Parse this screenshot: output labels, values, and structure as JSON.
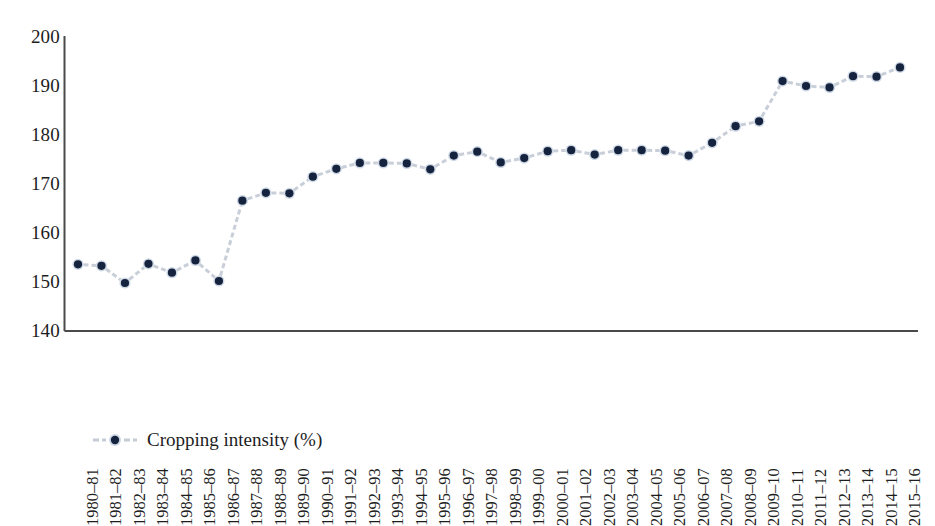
{
  "chart_data": {
    "type": "line",
    "title": "",
    "xlabel": "",
    "ylabel": "",
    "ylim": [
      140,
      200
    ],
    "ytick_step": 10,
    "yticks": [
      200,
      190,
      180,
      170,
      160,
      150,
      140
    ],
    "grid": false,
    "legend_position": "bottom-left",
    "marker": "circle",
    "line_style": "dashed",
    "series": [
      {
        "name": "Cropping intensity (%)",
        "color": "#15233f",
        "line_color": "#c9cfd8",
        "values": [
          153.6,
          153.3,
          149.8,
          153.7,
          151.9,
          154.4,
          150.2,
          166.6,
          168.2,
          168.1,
          171.5,
          173.1,
          174.3,
          174.3,
          174.2,
          173.0,
          175.8,
          176.6,
          174.4,
          175.3,
          176.7,
          176.9,
          176.0,
          176.9,
          176.9,
          176.8,
          175.8,
          178.4,
          181.8,
          182.8,
          191.0,
          190.0,
          189.7,
          192.0,
          191.9,
          193.8
        ]
      }
    ],
    "categories": [
      "1980–81",
      "1981–82",
      "1982–83",
      "1983–84",
      "1984–85",
      "1985–86",
      "1986–87",
      "1987–88",
      "1988–89",
      "1989–90",
      "1990–91",
      "1991–92",
      "1992–93",
      "1993–94",
      "1994–95",
      "1995–96",
      "1996–97",
      "1997–98",
      "1998–99",
      "1999–00",
      "2000–01",
      "2001–02",
      "2002–03",
      "2003–04",
      "2004–05",
      "2005–06",
      "2006–07",
      "2007–08",
      "2008–09",
      "2009–10",
      "2010–11",
      "2011–12",
      "2012–13",
      "2013–14",
      "2014–15",
      "2015–16"
    ]
  },
  "legend": {
    "label": "Cropping intensity (%)"
  },
  "colors": {
    "marker": "#15233f",
    "marker_halo": "#cfd9e6",
    "line": "#c6ccd6",
    "axis": "#4a4a4a",
    "text": "#1d1d1d",
    "background": "#ffffff"
  }
}
